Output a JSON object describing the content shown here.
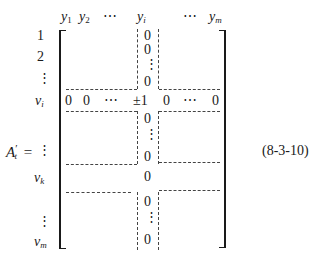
{
  "equation": {
    "lhs": "A",
    "lhs_prime": "′",
    "lhs_sub": "t",
    "equals": "=",
    "label": "(8-3-10)"
  },
  "column_headers": [
    {
      "base": "y",
      "sub": "1"
    },
    {
      "base": "y",
      "sub": "2"
    },
    {
      "text": "⋯"
    },
    {
      "base": "y",
      "sub": "i"
    },
    {
      "text": "⋯"
    },
    {
      "base": "y",
      "sub": "m"
    }
  ],
  "row_labels": [
    {
      "text": "1"
    },
    {
      "text": "2"
    },
    {
      "text": "⋮"
    },
    {
      "base": "v",
      "sub": "i"
    },
    {
      "text": "⋮"
    },
    {
      "base": "v",
      "sub": "k"
    },
    {
      "text": "⋮"
    },
    {
      "base": "v",
      "sub": "m"
    }
  ],
  "matrix": {
    "column_i": [
      "0",
      "0",
      "⋮",
      "0",
      "±1",
      "0",
      "⋮",
      "0",
      "0",
      "0",
      "⋮",
      "0"
    ],
    "row_i": [
      "0",
      "0",
      "⋯",
      "±1",
      "0",
      "⋯",
      "0"
    ]
  }
}
